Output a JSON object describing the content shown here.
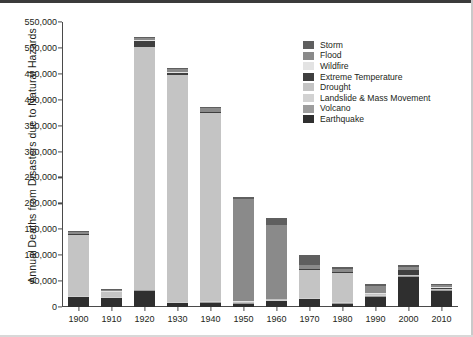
{
  "chart_data": {
    "type": "bar",
    "subtype": "stacked-bar",
    "title": "",
    "xlabel": "",
    "ylabel": "Annual Deaths from Disasters due to Natural Hazards",
    "ylim": [
      0,
      550000
    ],
    "ytick_values": [
      0,
      50000,
      100000,
      150000,
      200000,
      250000,
      300000,
      350000,
      400000,
      450000,
      500000,
      550000
    ],
    "ytick_labels": [
      "0",
      "50,000",
      "100,000",
      "150,000",
      "200,000",
      "250,000",
      "300,000",
      "350,000",
      "400,000",
      "450,000",
      "500,000",
      "550,000"
    ],
    "grid": false,
    "legend_position": "top-right",
    "categories": [
      "1900",
      "1910",
      "1920",
      "1930",
      "1940",
      "1950",
      "1960",
      "1970",
      "1980",
      "1990",
      "2000",
      "2010"
    ],
    "series": [
      {
        "name": "Storm",
        "color": "#5f5f5f",
        "values": [
          1500,
          1200,
          2000,
          2500,
          2000,
          3500,
          14000,
          19000,
          3500,
          3000,
          4000,
          2500
        ]
      },
      {
        "name": "Flood",
        "color": "#8a8a8a",
        "values": [
          4000,
          3000,
          4000,
          6000,
          6000,
          198000,
          142000,
          7000,
          5000,
          14000,
          6000,
          4000
        ]
      },
      {
        "name": "Wildfire",
        "color": "#e3e3e3",
        "values": [
          300,
          200,
          300,
          300,
          300,
          300,
          300,
          300,
          300,
          300,
          300,
          300
        ]
      },
      {
        "name": "Extreme Temperature",
        "color": "#3f3f3f",
        "values": [
          500,
          400,
          13000,
          6000,
          1000,
          500,
          500,
          1500,
          1500,
          1500,
          9000,
          3000
        ]
      },
      {
        "name": "Drought",
        "color": "#c4c4c4",
        "values": [
          119000,
          10000,
          468000,
          437000,
          365000,
          1000,
          1500,
          54000,
          57000,
          1500,
          1500,
          1000
        ]
      },
      {
        "name": "Landslide & Mass Movement",
        "color": "#d2d2d2",
        "values": [
          700,
          600,
          700,
          800,
          800,
          900,
          900,
          1200,
          1200,
          1200,
          1200,
          1000
        ]
      },
      {
        "name": "Volcano",
        "color": "#9d9d9d",
        "values": [
          1000,
          800,
          1000,
          1200,
          1200,
          1000,
          1000,
          1000,
          1000,
          1000,
          1000,
          800
        ]
      },
      {
        "name": "Earthquake",
        "color": "#2f2f2f",
        "values": [
          20000,
          18000,
          32000,
          8000,
          9000,
          7000,
          12000,
          16000,
          7000,
          21000,
          59000,
          32000
        ]
      }
    ],
    "stack_order_bottom_to_top": [
      "Earthquake",
      "Volcano",
      "Landslide & Mass Movement",
      "Drought",
      "Extreme Temperature",
      "Wildfire",
      "Flood",
      "Storm"
    ],
    "bar_totals": [
      147000,
      34200,
      521000,
      461800,
      385300,
      212200,
      172200,
      100000,
      76500,
      43500,
      82000,
      44600
    ],
    "legend_entries": [
      {
        "label": "Storm",
        "color": "#5f5f5f"
      },
      {
        "label": "Flood",
        "color": "#8a8a8a"
      },
      {
        "label": "Wildfire",
        "color": "#e3e3e3"
      },
      {
        "label": "Extreme Temperature",
        "color": "#3f3f3f"
      },
      {
        "label": "Drought",
        "color": "#c4c4c4"
      },
      {
        "label": "Landslide & Mass Movement",
        "color": "#d2d2d2"
      },
      {
        "label": "Volcano",
        "color": "#9d9d9d"
      },
      {
        "label": "Earthquake",
        "color": "#2f2f2f"
      }
    ]
  }
}
